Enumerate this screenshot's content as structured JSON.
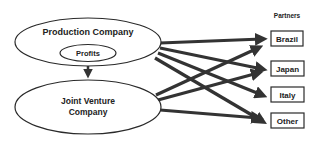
{
  "diagram": {
    "production": {
      "label": "Production Company"
    },
    "profits": {
      "label": "Profits"
    },
    "joint_venture": {
      "line1": "Joint Venture",
      "line2": "Company"
    },
    "partners_header": "Partners",
    "partners": [
      {
        "label": "Brazil"
      },
      {
        "label": "Japan"
      },
      {
        "label": "Italy"
      },
      {
        "label": "Other"
      }
    ],
    "colors": {
      "stroke": "#2a2a2a",
      "arrow": "#333333",
      "text": "#222222"
    }
  }
}
